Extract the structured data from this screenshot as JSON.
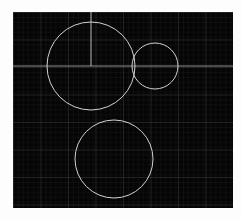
{
  "app": {
    "title": "Geometry Canvas",
    "background_color": "#fdfdfd"
  },
  "canvas": {
    "name": "grid-plot-canvas",
    "background_color": "#050505",
    "x": 13,
    "y": 12,
    "width": 220,
    "height": 196
  },
  "grid": {
    "minor_spacing": 5,
    "major_spacing": 27.5,
    "minor_color": "#1b1b1b",
    "major_color": "#3a3a3a",
    "show_minor": true,
    "show_major": true
  },
  "chart_data": {
    "type": "scatter",
    "title": "",
    "xlabel": "",
    "ylabel": "",
    "xlim": [
      0,
      220
    ],
    "ylim": [
      0,
      196
    ],
    "grid": true,
    "legend": null,
    "stroke_color": "#cfcfcf",
    "shapes": [
      {
        "id": "circle-large",
        "kind": "circle",
        "label": "Large circle",
        "cx": 78,
        "cy": 54,
        "r": 44,
        "stroke": "#d2d2d2",
        "stroke_width": 1,
        "fill": "none"
      },
      {
        "id": "circle-medium",
        "kind": "circle",
        "label": "Medium circle",
        "cx": 142,
        "cy": 54,
        "r": 23,
        "stroke": "#d2d2d2",
        "stroke_width": 1,
        "fill": "none"
      },
      {
        "id": "circle-bottom",
        "kind": "circle",
        "label": "Bottom circle",
        "cx": 101,
        "cy": 147,
        "r": 39,
        "stroke": "#d2d2d2",
        "stroke_width": 1,
        "fill": "none"
      },
      {
        "id": "axis-horizontal",
        "kind": "line",
        "label": "Horizontal axis line",
        "x1": 0,
        "y1": 54,
        "x2": 220,
        "y2": 54,
        "stroke": "#8d8d8d",
        "stroke_width": 1
      },
      {
        "id": "radius-vertical",
        "kind": "line",
        "label": "Vertical radius line",
        "x1": 78,
        "y1": 0,
        "x2": 78,
        "y2": 54,
        "stroke": "#b9b9b9",
        "stroke_width": 1
      }
    ]
  }
}
